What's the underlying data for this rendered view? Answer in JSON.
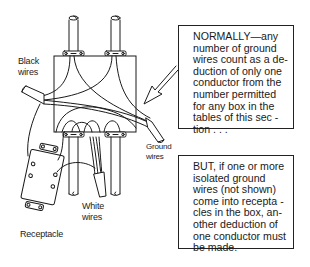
{
  "diagram": {
    "type": "electrical-junction-box-illustration",
    "labels": {
      "black_wires": "Black\nwires",
      "ground_wires": "Ground\nwires",
      "white_wires": "White\nwires",
      "receptacle": "Receptacle"
    },
    "callouts": {
      "normally": "NORMALLY—any\nnumber of ground\nwires count as a de-\nduction of only one\nconductor from the\nnumber permitted\nfor any box in the\ntables of this sec -\ntion . . .",
      "but": "BUT, if one or more\nisolated ground\nwires (not shown)\ncome into recepta -\ncles in the box, an-\nother deduction of\none conductor must\nbe made."
    },
    "colors": {
      "line": "#1a1a1a",
      "background": "#ffffff"
    }
  }
}
